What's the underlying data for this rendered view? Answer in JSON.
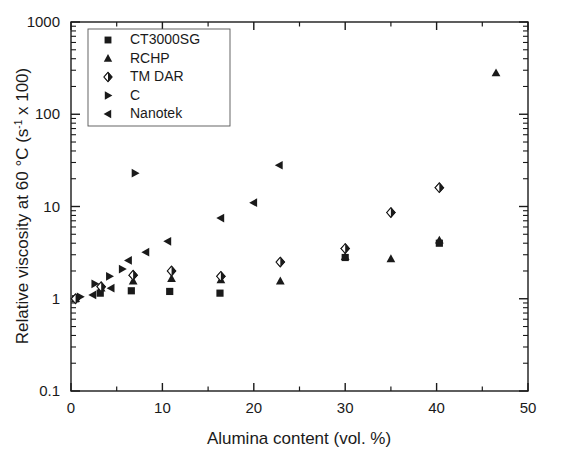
{
  "chart_data": {
    "type": "scatter",
    "title": "",
    "xlabel": "Alumina content (vol. %)",
    "ylabel": "Relative viscosity at 60 °C (s⁻¹ x 100)",
    "ylabel_parts": {
      "before": "Relative viscosity at 60 °C (s",
      "superscript": "-1",
      "after": " x 100)"
    },
    "xscale": "linear",
    "yscale": "log",
    "xlim": [
      0,
      50
    ],
    "ylim": [
      0.1,
      1000
    ],
    "xticks": [
      0,
      10,
      20,
      30,
      40,
      50
    ],
    "xtick_labels": [
      "0",
      "10",
      "20",
      "30",
      "40",
      "50"
    ],
    "yticks": [
      0.1,
      1,
      10,
      100,
      1000
    ],
    "ytick_labels": [
      "0.1",
      "1",
      "10",
      "100",
      "1000"
    ],
    "grid": false,
    "minor_ticks": true,
    "legend_position": "upper-left",
    "series": [
      {
        "name": "CT3000SG",
        "marker": "square",
        "color": "#1a1a1a",
        "points": [
          {
            "x": 0.5,
            "y": 1.0
          },
          {
            "x": 3.2,
            "y": 1.15
          },
          {
            "x": 6.6,
            "y": 1.22
          },
          {
            "x": 10.8,
            "y": 1.2
          },
          {
            "x": 16.3,
            "y": 1.15
          },
          {
            "x": 30.0,
            "y": 2.8
          },
          {
            "x": 40.3,
            "y": 4.0
          }
        ]
      },
      {
        "name": "RCHP",
        "marker": "triangle-up",
        "color": "#1a1a1a",
        "points": [
          {
            "x": 0.5,
            "y": 1.0
          },
          {
            "x": 3.3,
            "y": 1.3
          },
          {
            "x": 6.8,
            "y": 1.55
          },
          {
            "x": 11.0,
            "y": 1.65
          },
          {
            "x": 16.4,
            "y": 1.6
          },
          {
            "x": 22.9,
            "y": 1.55
          },
          {
            "x": 30.0,
            "y": 2.85
          },
          {
            "x": 35.0,
            "y": 2.7
          },
          {
            "x": 40.3,
            "y": 4.3
          },
          {
            "x": 46.5,
            "y": 280
          }
        ]
      },
      {
        "name": "TM DAR",
        "marker": "diamond",
        "color": "#1a1a1a",
        "points": [
          {
            "x": 0.5,
            "y": 1.0
          },
          {
            "x": 3.3,
            "y": 1.35
          },
          {
            "x": 6.8,
            "y": 1.8
          },
          {
            "x": 11.0,
            "y": 2.0
          },
          {
            "x": 16.4,
            "y": 1.75
          },
          {
            "x": 22.9,
            "y": 2.5
          },
          {
            "x": 30.0,
            "y": 3.5
          },
          {
            "x": 35.0,
            "y": 8.6
          },
          {
            "x": 40.3,
            "y": 16.0
          }
        ]
      },
      {
        "name": "C",
        "marker": "triangle-right",
        "color": "#1a1a1a",
        "points": [
          {
            "x": 1.0,
            "y": 1.05
          },
          {
            "x": 2.6,
            "y": 1.45
          },
          {
            "x": 4.2,
            "y": 1.75
          },
          {
            "x": 5.6,
            "y": 2.1
          },
          {
            "x": 7.0,
            "y": 23.0
          }
        ]
      },
      {
        "name": "Nanotek",
        "marker": "triangle-left",
        "color": "#1a1a1a",
        "points": [
          {
            "x": 2.4,
            "y": 1.1
          },
          {
            "x": 4.4,
            "y": 1.3
          },
          {
            "x": 6.3,
            "y": 2.6
          },
          {
            "x": 8.2,
            "y": 3.2
          },
          {
            "x": 10.6,
            "y": 4.2
          },
          {
            "x": 16.4,
            "y": 7.5
          },
          {
            "x": 20.0,
            "y": 11.0
          },
          {
            "x": 22.8,
            "y": 28.0
          }
        ]
      }
    ]
  },
  "legend": {
    "items": [
      {
        "label": "CT3000SG",
        "marker": "square"
      },
      {
        "label": "RCHP",
        "marker": "triangle-up"
      },
      {
        "label": "TM DAR",
        "marker": "diamond"
      },
      {
        "label": "C",
        "marker": "triangle-right"
      },
      {
        "label": "Nanotek",
        "marker": "triangle-left"
      }
    ]
  }
}
